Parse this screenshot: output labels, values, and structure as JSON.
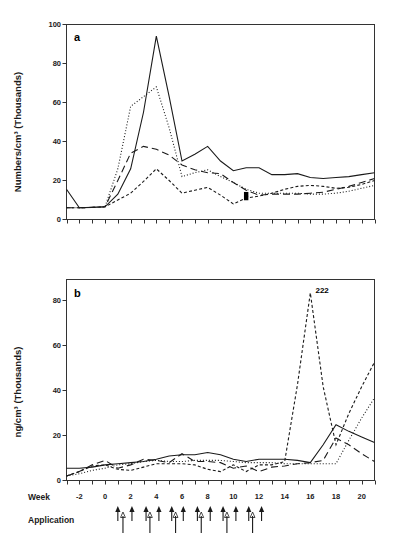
{
  "figure": {
    "background": "#ffffff",
    "line_color": "#1a1a1a"
  },
  "panel_a": {
    "letter": "a",
    "ylabel": "Numbers/cm³  (Thousands)",
    "ytick_labels": [
      "0",
      "20",
      "40",
      "60",
      "80",
      "100"
    ]
  },
  "panel_b": {
    "letter": "b",
    "ylabel": "ng/cm³  (Thousands)",
    "ytick_labels": [
      "0",
      "20",
      "40",
      "60",
      "80"
    ],
    "annotation": "222",
    "week_row_label": "Week",
    "application_row_label": "Application",
    "xtick_labels": [
      "-2",
      "0",
      "2",
      "4",
      "6",
      "8",
      "10",
      "12",
      "14",
      "16",
      "18",
      "20"
    ]
  },
  "chart_data": [
    {
      "type": "line",
      "panel": "a",
      "title": "a",
      "xlabel": "Week",
      "ylabel": "Numbers/cm³ (Thousands)",
      "xlim": [
        -3,
        21
      ],
      "ylim": [
        0,
        100
      ],
      "yticks": [
        0,
        20,
        40,
        60,
        80,
        100
      ],
      "xticks": [
        -3,
        -2,
        -1,
        0,
        1,
        2,
        3,
        4,
        5,
        6,
        7,
        8,
        9,
        10,
        11,
        12,
        13,
        14,
        15,
        16,
        17,
        18,
        19,
        20,
        21
      ],
      "xtick_labels_shown": false,
      "grid": false,
      "legend": "none",
      "series": [
        {
          "name": "series-1",
          "style": "solid",
          "x": [
            -3,
            -2,
            -1,
            0,
            1,
            2,
            3,
            4,
            5,
            6,
            7,
            8,
            9,
            10,
            11,
            12,
            13,
            14,
            15,
            16,
            17,
            18,
            19,
            20,
            21
          ],
          "y": [
            15.5,
            6.0,
            6.2,
            6.5,
            13.0,
            26.0,
            55.0,
            94.0,
            63.0,
            30.0,
            33.5,
            37.5,
            30.0,
            25.0,
            26.5,
            26.5,
            23.0,
            23.0,
            23.5,
            21.5,
            21.0,
            21.5,
            22.0,
            23.0,
            24.0
          ]
        },
        {
          "name": "series-2",
          "style": "dotted",
          "x": [
            -3,
            -2,
            -1,
            0,
            1,
            2,
            3,
            4,
            5,
            6,
            7,
            8,
            9,
            10,
            11,
            12,
            13,
            14,
            15,
            16,
            17,
            18,
            19,
            20,
            21
          ],
          "y": [
            6.0,
            6.0,
            6.2,
            6.5,
            26.0,
            58.0,
            63.0,
            68.0,
            47.0,
            22.0,
            24.0,
            25.5,
            22.0,
            19.0,
            15.5,
            13.5,
            13.5,
            13.5,
            13.5,
            13.0,
            13.0,
            13.5,
            14.5,
            16.0,
            17.5
          ]
        },
        {
          "name": "series-3",
          "style": "long-dash",
          "x": [
            -3,
            -2,
            -1,
            0,
            1,
            2,
            3,
            4,
            5,
            6,
            7,
            8,
            9,
            10,
            11,
            12,
            13,
            14,
            15,
            16,
            17,
            18,
            19,
            20,
            21
          ],
          "y": [
            6.0,
            6.0,
            6.2,
            6.5,
            20.0,
            34.0,
            37.5,
            36.0,
            33.0,
            28.0,
            25.5,
            24.0,
            23.5,
            19.0,
            15.0,
            12.5,
            13.0,
            13.0,
            13.0,
            13.5,
            14.0,
            15.5,
            17.0,
            19.0,
            21.0
          ]
        },
        {
          "name": "series-4",
          "style": "short-dash",
          "x": [
            -3,
            -2,
            -1,
            0,
            1,
            2,
            3,
            4,
            5,
            6,
            7,
            8,
            9,
            10,
            11,
            12,
            13,
            14,
            15,
            16,
            17,
            18,
            19,
            20,
            21
          ],
          "y": [
            6.0,
            6.0,
            6.2,
            6.5,
            10.0,
            13.5,
            19.5,
            26.0,
            20.0,
            13.5,
            15.0,
            16.5,
            12.5,
            8.0,
            11.0,
            12.0,
            13.5,
            15.5,
            17.0,
            17.5,
            17.0,
            16.0,
            16.5,
            18.0,
            20.0
          ]
        }
      ],
      "markers": [
        {
          "x": 11,
          "y": 13.0,
          "shape": "square"
        },
        {
          "x": 11,
          "y": 11.0,
          "shape": "square"
        }
      ]
    },
    {
      "type": "line",
      "panel": "b",
      "title": "b",
      "xlabel": "Week",
      "ylabel": "ng/cm³ (Thousands)",
      "xlim": [
        -3,
        21
      ],
      "ylim": [
        0,
        90
      ],
      "yticks": [
        0,
        20,
        40,
        60,
        80
      ],
      "xticks": [
        -3,
        -2,
        -1,
        0,
        1,
        2,
        3,
        4,
        5,
        6,
        7,
        8,
        9,
        10,
        11,
        12,
        13,
        14,
        15,
        16,
        17,
        18,
        19,
        20,
        21
      ],
      "grid": false,
      "legend": "none",
      "annotations": [
        {
          "text": "222",
          "x": 16.4,
          "y": 84.0
        }
      ],
      "series": [
        {
          "name": "series-1",
          "style": "solid",
          "x": [
            -3,
            -2,
            -1,
            0,
            1,
            2,
            3,
            4,
            5,
            6,
            7,
            8,
            9,
            10,
            11,
            12,
            13,
            14,
            15,
            16,
            17,
            18,
            19,
            20,
            21
          ],
          "y": [
            5.5,
            5.5,
            6.0,
            7.0,
            7.5,
            8.0,
            8.5,
            9.5,
            11.0,
            11.5,
            11.5,
            12.5,
            11.5,
            9.5,
            8.5,
            9.5,
            9.5,
            9.5,
            9.0,
            8.0,
            16.0,
            25.0,
            22.0,
            19.5,
            17.0
          ]
        },
        {
          "name": "series-2",
          "style": "dotted",
          "x": [
            -3,
            -2,
            -1,
            0,
            1,
            2,
            3,
            4,
            5,
            6,
            7,
            8,
            9,
            10,
            11,
            12,
            13,
            14,
            15,
            16,
            17,
            18,
            19,
            20,
            21
          ],
          "y": [
            2.0,
            3.0,
            4.5,
            5.5,
            7.0,
            7.5,
            8.5,
            9.0,
            8.5,
            8.5,
            9.0,
            9.0,
            9.0,
            8.5,
            8.0,
            8.0,
            8.0,
            7.5,
            7.5,
            7.5,
            7.5,
            7.5,
            18.0,
            28.0,
            37.0
          ]
        },
        {
          "name": "series-3",
          "style": "long-dash",
          "x": [
            -3,
            -2,
            -1,
            0,
            1,
            2,
            3,
            4,
            5,
            6,
            7,
            8,
            9,
            10,
            11,
            12,
            13,
            14,
            15,
            16,
            17,
            18,
            19,
            20,
            21
          ],
          "y": [
            2.0,
            4.0,
            7.0,
            9.0,
            5.5,
            7.0,
            9.5,
            9.0,
            8.0,
            12.0,
            8.5,
            8.5,
            8.0,
            5.5,
            6.5,
            4.0,
            6.0,
            6.5,
            7.5,
            8.0,
            9.0,
            19.0,
            16.0,
            12.0,
            8.5
          ]
        },
        {
          "name": "series-4",
          "style": "short-dash",
          "x": [
            -3,
            -2,
            -1,
            0,
            1,
            2,
            3,
            4,
            5,
            6,
            7,
            8,
            9,
            10,
            11,
            12,
            13,
            14,
            15,
            16,
            17,
            18,
            19,
            20,
            21
          ],
          "y": [
            2.0,
            4.0,
            6.5,
            7.0,
            5.0,
            4.5,
            6.0,
            7.5,
            7.5,
            7.5,
            7.0,
            5.0,
            4.0,
            7.0,
            4.0,
            7.0,
            7.0,
            8.5,
            43.0,
            84.0,
            42.0,
            16.0,
            30.0,
            42.0,
            53.0
          ]
        }
      ]
    }
  ],
  "applications": {
    "filled_arrow_weeks": [
      1.0,
      2.1,
      3.2,
      4.2,
      5.2,
      6.1,
      7.2,
      8.2,
      9.2,
      10.2,
      11.2,
      12.2
    ],
    "open_arrow_weeks": [
      1.4,
      3.5,
      5.5,
      7.5,
      9.5,
      11.5
    ]
  }
}
